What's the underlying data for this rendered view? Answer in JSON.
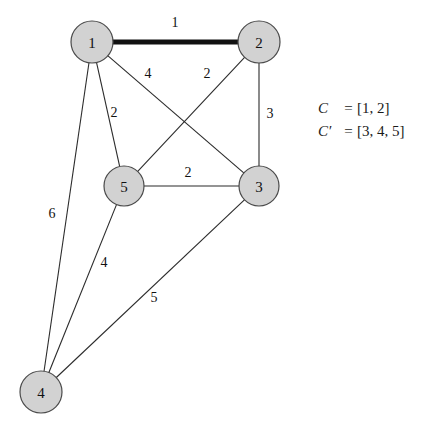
{
  "figure": {
    "background": "#ffffff",
    "node_fill": "#d2d2d2",
    "node_stroke": "#4a4a4a",
    "edge_color": "#2b2b2b",
    "highlight_color": "#111111"
  },
  "graph": {
    "nodes": [
      {
        "id": "1",
        "label": "1",
        "cx": 92,
        "cy": 42,
        "r": 21
      },
      {
        "id": "2",
        "label": "2",
        "cx": 259,
        "cy": 42,
        "r": 21
      },
      {
        "id": "5",
        "label": "5",
        "cx": 124,
        "cy": 186,
        "r": 20
      },
      {
        "id": "3",
        "label": "3",
        "cx": 259,
        "cy": 186,
        "r": 20
      },
      {
        "id": "4",
        "label": "4",
        "cx": 41,
        "cy": 392,
        "r": 21
      }
    ],
    "edges": [
      {
        "from": "1",
        "to": "2",
        "weight": "1",
        "bold": true,
        "label_x": 175,
        "label_y": 22
      },
      {
        "from": "1",
        "to": "3",
        "weight": "4",
        "bold": false,
        "label_x": 148,
        "label_y": 73
      },
      {
        "from": "2",
        "to": "5",
        "weight": "2",
        "bold": false,
        "label_x": 207,
        "label_y": 73
      },
      {
        "from": "1",
        "to": "5",
        "weight": "2",
        "bold": false,
        "label_x": 114,
        "label_y": 112
      },
      {
        "from": "2",
        "to": "3",
        "weight": "3",
        "bold": false,
        "label_x": 270,
        "label_y": 113
      },
      {
        "from": "5",
        "to": "3",
        "weight": "2",
        "bold": false,
        "label_x": 188,
        "label_y": 172
      },
      {
        "from": "1",
        "to": "4",
        "weight": "6",
        "bold": false,
        "label_x": 52,
        "label_y": 213
      },
      {
        "from": "5",
        "to": "4",
        "weight": "4",
        "bold": false,
        "label_x": 104,
        "label_y": 262
      },
      {
        "from": "3",
        "to": "4",
        "weight": "5",
        "bold": false,
        "label_x": 154,
        "label_y": 297
      }
    ]
  },
  "legend": {
    "rows": [
      {
        "symbol": "C",
        "equals": "=",
        "value": "[1, 2]"
      },
      {
        "symbol": "C′",
        "equals": "=",
        "value": "[3, 4, 5]"
      }
    ]
  }
}
